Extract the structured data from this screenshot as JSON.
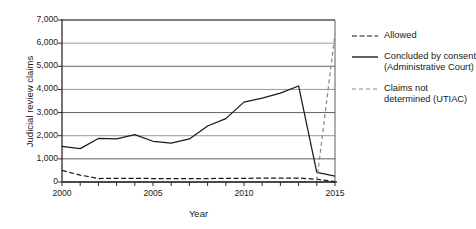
{
  "chart_data": {
    "type": "line",
    "title": "",
    "xlabel": "Year",
    "ylabel": "Judicial review claims",
    "xlim": [
      2000,
      2015
    ],
    "ylim": [
      0,
      7000
    ],
    "grid": true,
    "legend_position": "right",
    "x": [
      2000,
      2001,
      2002,
      2003,
      2004,
      2005,
      2006,
      2007,
      2008,
      2009,
      2010,
      2011,
      2012,
      2013,
      2014,
      2015
    ],
    "y_ticks": [
      "0",
      "1,000",
      "2,000",
      "3,000",
      "4,000",
      "5,000",
      "6,000",
      "7,000"
    ],
    "y_tick_values": [
      0,
      1000,
      2000,
      3000,
      4000,
      5000,
      6000,
      7000
    ],
    "x_tick_labels": [
      "2000",
      "2005",
      "2010",
      "2015"
    ],
    "x_tick_values": [
      2000,
      2005,
      2010,
      2015
    ],
    "series": [
      {
        "name": "Allowed",
        "style": "dashed",
        "color": "#1a1a1a",
        "x": [
          2000,
          2001,
          2002,
          2003,
          2004,
          2005,
          2006,
          2007,
          2008,
          2009,
          2010,
          2011,
          2012,
          2013,
          2014,
          2015
        ],
        "values": [
          500,
          300,
          150,
          160,
          160,
          150,
          150,
          150,
          150,
          155,
          160,
          165,
          170,
          170,
          120,
          20
        ]
      },
      {
        "name": "Concluded by consent\n(Administrative\nCourt)",
        "style": "solid",
        "color": "#1a1a1a",
        "x": [
          2000,
          2001,
          2002,
          2003,
          2004,
          2005,
          2006,
          2007,
          2008,
          2009,
          2010,
          2011,
          2012,
          2013,
          2014,
          2015
        ],
        "values": [
          1540,
          1440,
          1880,
          1860,
          2050,
          1760,
          1680,
          1860,
          2420,
          2740,
          3450,
          3620,
          3840,
          4150,
          420,
          250
        ]
      },
      {
        "name": "Claims not\ndetermined\n(UTIAC)",
        "style": "dashed",
        "color": "#8a8a8a",
        "x": [
          2014,
          2015
        ],
        "values": [
          60,
          6400
        ]
      }
    ]
  },
  "legend": {
    "items": [
      {
        "label": "Allowed",
        "style": "dashed",
        "color": "#1a1a1a"
      },
      {
        "label": "Concluded by consent (Administrative Court)",
        "style": "solid",
        "color": "#1a1a1a"
      },
      {
        "label": "Claims not determined (UTIAC)",
        "style": "dashed",
        "color": "#8a8a8a"
      }
    ]
  }
}
